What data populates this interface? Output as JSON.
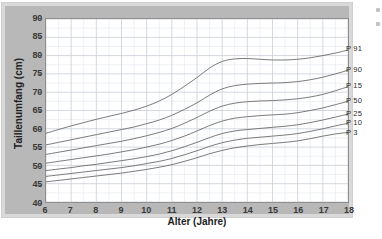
{
  "chart_data": {
    "type": "line",
    "title": "",
    "xlabel": "Alter (Jahre)",
    "ylabel": "Taillenumfang (cm)",
    "xlim": [
      6,
      18
    ],
    "ylim": [
      40,
      90
    ],
    "xticks": [
      6,
      7,
      8,
      9,
      10,
      11,
      12,
      13,
      14,
      15,
      16,
      17,
      18
    ],
    "yticks": [
      40,
      45,
      50,
      55,
      60,
      65,
      70,
      75,
      80,
      85,
      90
    ],
    "grid": true,
    "minor_grid": true,
    "legend_position": "right-end-of-line",
    "x": [
      6,
      6.5,
      7,
      7.5,
      8,
      8.5,
      9,
      9.5,
      10,
      10.5,
      11,
      11.5,
      12,
      12.5,
      13,
      13.5,
      14,
      14.5,
      15,
      15.5,
      16,
      16.5,
      17,
      17.5,
      18
    ],
    "series": [
      {
        "name": "P 91",
        "values": [
          58.8,
          59.8,
          60.8,
          61.7,
          62.6,
          63.4,
          64.2,
          65.1,
          66.2,
          67.6,
          69.4,
          71.6,
          74.0,
          76.6,
          78.4,
          79.1,
          79.2,
          79.0,
          78.8,
          78.8,
          79.0,
          79.4,
          80.0,
          80.7,
          81.5
        ]
      },
      {
        "name": "P 90",
        "values": [
          55.6,
          56.3,
          57.0,
          57.7,
          58.4,
          59.1,
          59.8,
          60.5,
          61.4,
          62.4,
          63.7,
          65.3,
          67.1,
          69.2,
          70.9,
          71.8,
          72.2,
          72.4,
          72.5,
          72.6,
          72.9,
          73.4,
          74.1,
          75.0,
          76.0
        ]
      },
      {
        "name": "P 15",
        "values": [
          53.0,
          53.6,
          54.2,
          54.8,
          55.4,
          56.0,
          56.6,
          57.3,
          58.1,
          59.0,
          60.1,
          61.5,
          63.1,
          64.8,
          66.2,
          67.0,
          67.4,
          67.6,
          67.7,
          67.9,
          68.2,
          68.7,
          69.4,
          70.4,
          71.5
        ]
      },
      {
        "name": "P 50",
        "values": [
          50.6,
          51.1,
          51.6,
          52.1,
          52.6,
          53.1,
          53.7,
          54.3,
          55.0,
          55.8,
          56.8,
          58.0,
          59.4,
          60.9,
          62.1,
          62.9,
          63.3,
          63.6,
          63.8,
          64.0,
          64.4,
          65.0,
          65.7,
          66.6,
          67.5
        ]
      },
      {
        "name": "P 25",
        "values": [
          48.6,
          49.0,
          49.4,
          49.9,
          50.3,
          50.8,
          51.3,
          51.8,
          52.4,
          53.1,
          54.0,
          55.1,
          56.3,
          57.6,
          58.7,
          59.4,
          59.8,
          60.1,
          60.4,
          60.7,
          61.1,
          61.7,
          62.4,
          63.2,
          64.0
        ]
      },
      {
        "name": "P 10",
        "values": [
          47.0,
          47.4,
          47.8,
          48.2,
          48.6,
          49.0,
          49.4,
          49.9,
          50.5,
          51.1,
          51.9,
          52.9,
          54.0,
          55.2,
          56.2,
          56.9,
          57.4,
          57.7,
          58.0,
          58.3,
          58.7,
          59.3,
          60.0,
          60.8,
          61.5
        ]
      },
      {
        "name": "P 3",
        "values": [
          45.5,
          45.9,
          46.3,
          46.7,
          47.1,
          47.5,
          47.9,
          48.4,
          48.9,
          49.5,
          50.2,
          51.1,
          52.1,
          53.2,
          54.1,
          54.8,
          55.3,
          55.7,
          56.0,
          56.3,
          56.7,
          57.3,
          58.0,
          58.6,
          59.0
        ]
      }
    ],
    "line_color": "#6b6b6b",
    "grid_color": "#c9cfd8",
    "plot_background": "#ffffff",
    "mat_color": "#b8b8b8",
    "frame_color": "#d9d9d9"
  }
}
